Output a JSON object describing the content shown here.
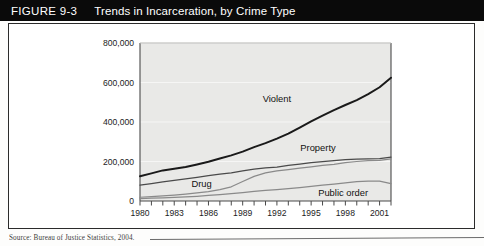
{
  "figure": {
    "number": "FIGURE 9-3",
    "title": "Trends in Incarceration, by Crime Type",
    "source": "Source: Bureau of Justice Statistics, 2004."
  },
  "chart_data": {
    "type": "line",
    "title": "Trends in Incarceration, by Crime Type",
    "xlabel": "",
    "ylabel": "",
    "xlim": [
      1980,
      2002
    ],
    "ylim": [
      0,
      800000
    ],
    "yticks": [
      0,
      200000,
      400000,
      600000,
      800000
    ],
    "ytick_labels": [
      "0",
      "200,000",
      "400,000",
      "600,000",
      "800,000"
    ],
    "xticks": [
      1980,
      1981,
      1982,
      1983,
      1984,
      1985,
      1986,
      1987,
      1988,
      1989,
      1990,
      1991,
      1992,
      1993,
      1994,
      1995,
      1996,
      1997,
      1998,
      1999,
      2000,
      2001,
      2002
    ],
    "xtick_labels": [
      "1980",
      "",
      "",
      "1983",
      "",
      "",
      "1986",
      "",
      "",
      "1989",
      "",
      "",
      "1992",
      "",
      "",
      "1995",
      "",
      "",
      "1998",
      "",
      "",
      "2001",
      ""
    ],
    "grid": true,
    "legend_position": "inline-annotations",
    "x": [
      1980,
      1981,
      1982,
      1983,
      1984,
      1985,
      1986,
      1987,
      1988,
      1989,
      1990,
      1991,
      1992,
      1993,
      1994,
      1995,
      1996,
      1997,
      1998,
      1999,
      2000,
      2001,
      2002
    ],
    "series": [
      {
        "name": "Violent",
        "color": "#1a1a1a",
        "values": [
          125000,
          140000,
          155000,
          163000,
          172000,
          185000,
          199000,
          215000,
          231000,
          250000,
          273000,
          293000,
          316000,
          341000,
          372000,
          403000,
          432000,
          460000,
          486000,
          511000,
          541000,
          576000,
          624000
        ]
      },
      {
        "name": "Property",
        "color": "#4a4a4a",
        "values": [
          80000,
          88000,
          97000,
          104000,
          112000,
          120000,
          128000,
          136000,
          143000,
          152000,
          161000,
          168000,
          172000,
          180000,
          187000,
          194000,
          199000,
          205000,
          210000,
          212000,
          213000,
          214000,
          222000
        ]
      },
      {
        "name": "Drug",
        "color": "#8a8a8a",
        "values": [
          19000,
          22000,
          26000,
          30000,
          35000,
          41000,
          48000,
          58000,
          72000,
          99000,
          125000,
          142000,
          152000,
          159000,
          166000,
          173000,
          180000,
          186000,
          194000,
          200000,
          204000,
          206000,
          213000
        ]
      },
      {
        "name": "Public order",
        "color": "#8a8a8a",
        "values": [
          12000,
          14000,
          16000,
          18000,
          21000,
          24000,
          28000,
          32000,
          37000,
          43000,
          49000,
          54000,
          58000,
          63000,
          68000,
          74000,
          80000,
          86000,
          92000,
          98000,
          101000,
          101000,
          88000
        ]
      }
    ],
    "annotations": [
      {
        "label": "Violent",
        "x": 1992,
        "y": 500000
      },
      {
        "label": "Property",
        "x": 1995.6,
        "y": 255000
      },
      {
        "label": "Drug",
        "x": 1985.4,
        "y": 73000
      },
      {
        "label": "Public order",
        "x": 2000.0,
        "y": 26000
      }
    ]
  }
}
